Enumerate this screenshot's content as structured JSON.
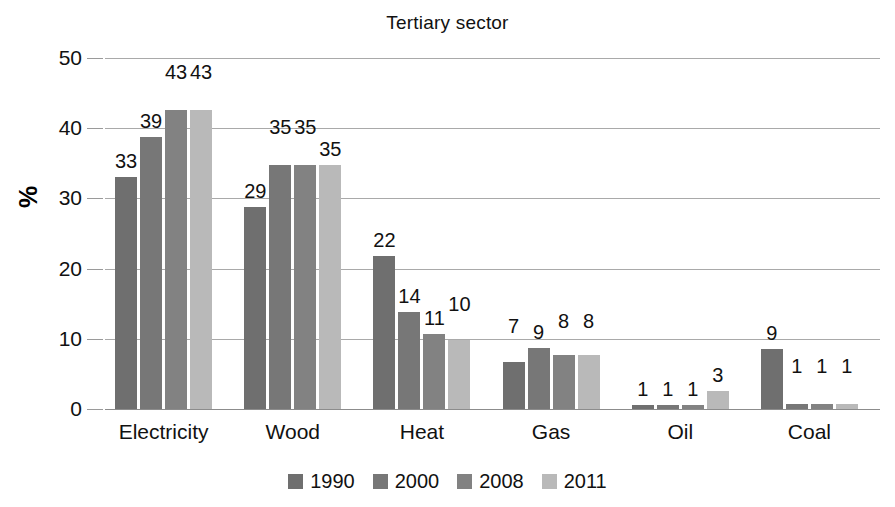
{
  "chart_data": {
    "type": "bar",
    "title": "Tertiary sector",
    "xlabel": "",
    "ylabel": "%",
    "ylim": [
      0,
      50
    ],
    "ytick_labels": [
      "50",
      "40",
      "30",
      "20",
      "10",
      "0"
    ],
    "yticks": [
      50,
      40,
      30,
      20,
      10,
      0
    ],
    "grid": true,
    "legend_position": "bottom",
    "categories": [
      "Electricity",
      "Wood",
      "Heat",
      "Gas",
      "Oil",
      "Coal"
    ],
    "series": [
      {
        "name": "1990",
        "color": "#6f6f6f",
        "values": [
          33,
          29,
          22,
          7,
          1,
          9
        ],
        "heights": [
          33.0,
          28.8,
          21.8,
          6.7,
          0.6,
          8.5
        ],
        "labels": [
          "33",
          "29",
          "22",
          "7",
          "1",
          "9"
        ]
      },
      {
        "name": "2000",
        "color": "#777777",
        "values": [
          39,
          35,
          14,
          9,
          1,
          1
        ],
        "heights": [
          38.8,
          34.7,
          13.8,
          8.7,
          0.6,
          0.7
        ],
        "labels": [
          "39",
          "35",
          "14",
          "9",
          "1",
          "1"
        ]
      },
      {
        "name": "2008",
        "color": "#828282",
        "values": [
          43,
          35,
          11,
          8,
          1,
          1
        ],
        "heights": [
          42.6,
          34.7,
          10.7,
          7.7,
          0.6,
          0.7
        ],
        "labels": [
          "43",
          "35",
          "11",
          "8",
          "1",
          "1"
        ]
      },
      {
        "name": "2011",
        "color": "#b9b9b9",
        "values": [
          43,
          35,
          10,
          8,
          3,
          1
        ],
        "heights": [
          42.6,
          34.7,
          9.8,
          7.7,
          2.5,
          0.7
        ],
        "labels": [
          "43",
          "35",
          "10",
          "8",
          "3",
          "1"
        ]
      }
    ]
  },
  "legend": {
    "items": [
      {
        "label": "1990",
        "color": "#6f6f6f"
      },
      {
        "label": "2000",
        "color": "#777777"
      },
      {
        "label": "2008",
        "color": "#828282"
      },
      {
        "label": "2011",
        "color": "#b9b9b9"
      }
    ]
  }
}
